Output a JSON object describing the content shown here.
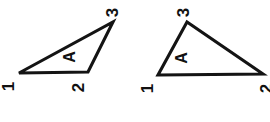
{
  "figure": {
    "background_color": "#ffffff",
    "ink_color": "#141414",
    "shapes": [
      {
        "id": "triangle-left",
        "name": "triangle-left",
        "region_label": "A",
        "points": "19,73 88,72 113,22",
        "vertices": [
          {
            "label": "1",
            "x": 19,
            "y": 73
          },
          {
            "label": "2",
            "x": 88,
            "y": 72
          },
          {
            "label": "3",
            "x": 113,
            "y": 22
          }
        ]
      },
      {
        "id": "triangle-right",
        "name": "triangle-right",
        "region_label": "A",
        "points": "158,75 263,74 187,22",
        "vertices": [
          {
            "label": "1",
            "x": 158,
            "y": 75
          },
          {
            "label": "2",
            "x": 263,
            "y": 74
          },
          {
            "label": "3",
            "x": 187,
            "y": 22
          }
        ]
      }
    ],
    "labels": {
      "left_vertex_1": "1",
      "left_vertex_2": "2",
      "left_vertex_3": "3",
      "left_region": "A",
      "right_vertex_1": "1",
      "right_vertex_2": "2",
      "right_vertex_3": "3",
      "right_region": "A"
    }
  }
}
